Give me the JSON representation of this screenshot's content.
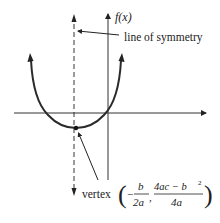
{
  "diagram": {
    "colors": {
      "ink": "#222222",
      "curve": "#2a2a2a",
      "background": "#ffffff"
    },
    "labels": {
      "y_axis": "f(x)",
      "symmetry": "line of symmetry",
      "vertex_word": "vertex",
      "vertex_x_num": "b",
      "vertex_x_den": "2a",
      "vertex_y_num": "4ac − b",
      "vertex_y_sup": "2",
      "vertex_y_den": "4a",
      "minus": "−",
      "comma": ",",
      "open_paren": "(",
      "close_paren": ")"
    },
    "geometry": {
      "x_axis_y": 113,
      "y_axis_x": 108,
      "symmetry_x": 74,
      "vertex": [
        76,
        128
      ]
    }
  }
}
